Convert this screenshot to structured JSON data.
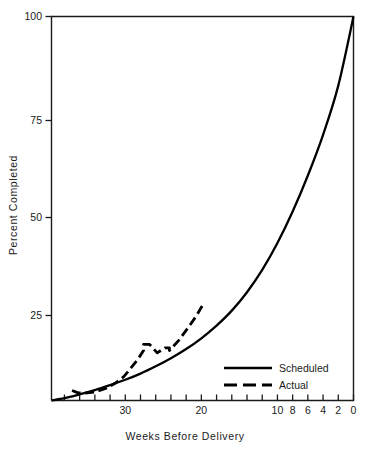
{
  "chart_data": {
    "type": "line",
    "title": "",
    "subtitle": "",
    "xlabel": "Weeks Before Delivery",
    "ylabel": "Percent  Completed",
    "xlim": [
      39.7,
      0
    ],
    "ylim": [
      0,
      100
    ],
    "x_inverted": true,
    "grid": false,
    "legend_position": "inside-bottom-right",
    "x_ticks_major": [
      "30",
      "20",
      "10",
      "8",
      "6",
      "4",
      "2",
      "0"
    ],
    "x_tick_major_values": [
      30,
      20,
      10,
      8,
      6,
      4,
      2,
      0
    ],
    "x_tick_minor_values": [
      38,
      36,
      34,
      32,
      28,
      26,
      24,
      22,
      18,
      16,
      14,
      12
    ],
    "y_ticks": [
      "100",
      "75",
      "50",
      "25"
    ],
    "y_tick_values": [
      100,
      75,
      50,
      25
    ],
    "series": [
      {
        "name": "Scheduled",
        "style": "solid",
        "color": "#000000",
        "x": [
          39.7,
          38,
          36,
          34,
          32,
          30,
          28,
          26,
          24,
          22,
          20,
          18,
          16,
          14,
          12,
          10,
          8,
          6,
          4,
          2,
          0
        ],
        "y": [
          0,
          0.6,
          1.6,
          2.7,
          4.0,
          5.4,
          7.0,
          8.9,
          11.0,
          13.4,
          16.2,
          19.5,
          23.4,
          28.2,
          34.0,
          41.0,
          49.2,
          58.6,
          69.2,
          82.0,
          100.0
        ]
      },
      {
        "name": "Actual",
        "style": "dashed",
        "color": "#000000",
        "x": [
          37.0,
          36.2,
          35.4,
          34.0,
          32.5,
          31.4,
          30.2,
          29.2,
          28.4,
          27.6,
          27.6,
          26.8,
          25.8,
          24.8,
          24.2,
          24.2,
          23.0,
          21.8,
          20.6,
          19.9
        ],
        "y": [
          2.6,
          2.0,
          1.9,
          2.2,
          3.2,
          4.4,
          6.2,
          8.6,
          10.6,
          13.0,
          14.6,
          14.6,
          12.4,
          13.7,
          13.7,
          13.0,
          15.6,
          18.8,
          22.2,
          24.6
        ]
      }
    ],
    "annotations": []
  },
  "legend": {
    "entries": [
      {
        "label": "Scheduled",
        "style": "solid"
      },
      {
        "label": "Actual",
        "style": "dashed"
      }
    ]
  },
  "colors": {
    "ink": "#1a1a1a",
    "curve": "#000000",
    "background": "#ffffff"
  }
}
